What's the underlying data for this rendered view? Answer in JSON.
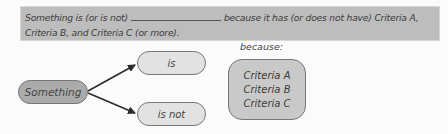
{
  "banner": {
    "part1": "Something is (or is not)",
    "part2": "because it has (or does not have) Criteria A,",
    "line2": "Criteria B, and Criteria C (or more)."
  },
  "diagram": {
    "subject": "Something",
    "branch_positive": "is",
    "branch_negative": "is not",
    "because_label": "because:",
    "criteria": [
      "Criteria A",
      "Criteria B",
      "Criteria C"
    ]
  },
  "colors": {
    "banner_bg": "#bdbdbd",
    "subject_fill": "#ababab",
    "branch_fill": "#e2e2e2",
    "criteria_fill": "#c9c9c9",
    "arrow": "#2b2b2b"
  }
}
